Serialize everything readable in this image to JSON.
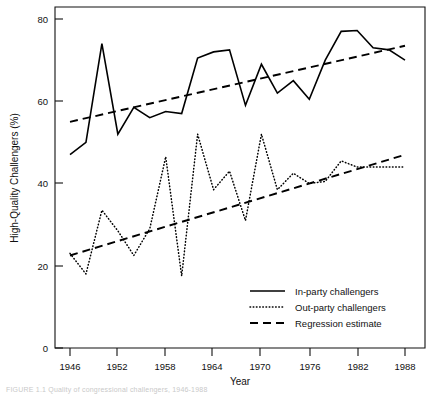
{
  "figure": {
    "caption": "FIGURE 1.1  Quality of congressional challengers, 1946-1988",
    "background_color": "#ffffff",
    "ink_color": "#000000"
  },
  "chart_data": {
    "type": "line",
    "title": "",
    "subtitle": "",
    "xlabel": "Year",
    "ylabel": "High-Quality Challengers (%)",
    "xlim": [
      1946,
      1988
    ],
    "ylim": [
      0,
      82
    ],
    "grid": false,
    "legend_position": "bottom-right",
    "x_tick_labels": [
      "1946",
      "1952",
      "1958",
      "1964",
      "1970",
      "1976",
      "1982",
      "1988"
    ],
    "x_ticks": [
      1946,
      1952,
      1958,
      1964,
      1970,
      1976,
      1982,
      1988
    ],
    "y_tick_labels": [
      "0",
      "20",
      "40",
      "60",
      "80"
    ],
    "y_ticks": [
      0,
      20,
      40,
      60,
      80
    ],
    "x": [
      1946,
      1948,
      1950,
      1952,
      1954,
      1956,
      1958,
      1960,
      1962,
      1964,
      1966,
      1968,
      1970,
      1972,
      1974,
      1976,
      1978,
      1980,
      1982,
      1984,
      1986,
      1988
    ],
    "series": [
      {
        "name": "In-party challengers",
        "style": "solid",
        "values": [
          47.0,
          50.0,
          74.0,
          52.0,
          58.5,
          56.0,
          57.5,
          57.0,
          70.5,
          72.0,
          72.5,
          59.0,
          69.0,
          62.0,
          65.0,
          60.5,
          70.0,
          77.0,
          77.2,
          73.0,
          72.5,
          70.0
        ]
      },
      {
        "name": "Out-party challengers",
        "style": "dotted",
        "values": [
          23.0,
          18.0,
          33.5,
          28.5,
          22.5,
          29.0,
          46.5,
          17.5,
          52.0,
          38.5,
          43.0,
          31.0,
          52.0,
          38.5,
          42.5,
          40.0,
          40.5,
          45.5,
          44.0,
          44.0,
          44.0,
          44.0
        ]
      },
      {
        "name": "Regression estimate",
        "style": "dashed",
        "segments": [
          {
            "for": "In-party challengers",
            "x": [
              1946,
              1988
            ],
            "y": [
              55.0,
              73.5
            ]
          },
          {
            "for": "Out-party challengers",
            "x": [
              1946,
              1988
            ],
            "y": [
              22.5,
              47.0
            ]
          }
        ]
      }
    ],
    "legend": [
      {
        "label": "In-party challengers",
        "style": "solid"
      },
      {
        "label": "Out-party challengers",
        "style": "dotted"
      },
      {
        "label": "Regression estimate",
        "style": "dashed"
      }
    ]
  }
}
